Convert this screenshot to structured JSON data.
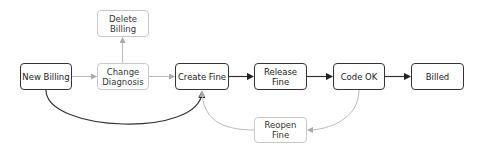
{
  "diagram": {
    "type": "state-flow",
    "nodes": [
      {
        "id": "delete_billing",
        "label": "Delete\nBilling",
        "style": "alt"
      },
      {
        "id": "new_billing",
        "label": "New Billing",
        "style": "main"
      },
      {
        "id": "change_diagnosis",
        "label": "Change\nDiagnosis",
        "style": "alt"
      },
      {
        "id": "create_fine",
        "label": "Create Fine",
        "style": "main"
      },
      {
        "id": "release_fine",
        "label": "Release\nFine",
        "style": "main"
      },
      {
        "id": "code_ok",
        "label": "Code OK",
        "style": "main"
      },
      {
        "id": "billed",
        "label": "Billed",
        "style": "main"
      },
      {
        "id": "reopen_fine",
        "label": "Reopen\nFine",
        "style": "alt"
      }
    ],
    "edges": [
      {
        "from": "new_billing",
        "to": "change_diagnosis",
        "style": "alt"
      },
      {
        "from": "change_diagnosis",
        "to": "delete_billing",
        "style": "alt"
      },
      {
        "from": "change_diagnosis",
        "to": "create_fine",
        "style": "alt"
      },
      {
        "from": "new_billing",
        "to": "create_fine",
        "style": "main"
      },
      {
        "from": "create_fine",
        "to": "release_fine",
        "style": "main"
      },
      {
        "from": "release_fine",
        "to": "code_ok",
        "style": "main"
      },
      {
        "from": "code_ok",
        "to": "billed",
        "style": "main"
      },
      {
        "from": "code_ok",
        "to": "reopen_fine",
        "style": "alt"
      },
      {
        "from": "reopen_fine",
        "to": "create_fine",
        "style": "alt"
      }
    ],
    "colors": {
      "main": "#333333",
      "alt": "#c8c8c8"
    }
  }
}
